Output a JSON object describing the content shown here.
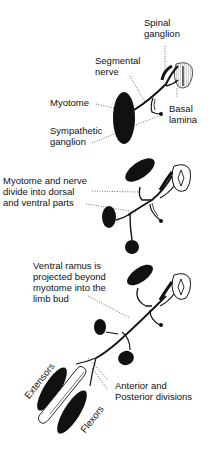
{
  "diagram": {
    "type": "anatomical-stages",
    "colors": {
      "ink": "#111111",
      "background": "#ffffff",
      "hatch": "#888888"
    },
    "stages": [
      {
        "id": "stage-1",
        "labels": {
          "spinal_ganglion": "Spinal\nganglion",
          "segmental_nerve": "Segmental\nnerve",
          "myotome": "Myotome",
          "sympathetic_ganglion": "Sympathetic\nganglion",
          "basal_lamina": "Basal\nlamina"
        }
      },
      {
        "id": "stage-2",
        "labels": {
          "divide": "Myotome and nerve\ndivide into dorsal\nand ventral parts"
        }
      },
      {
        "id": "stage-3",
        "labels": {
          "ventral_ramus": "Ventral ramus is\nprojected beyond\nmyotome into the\nlimb bud",
          "divisions": "Anterior and\nPosterior divisions",
          "extensors": "Extensors",
          "flexors": "Flexors"
        }
      }
    ]
  }
}
